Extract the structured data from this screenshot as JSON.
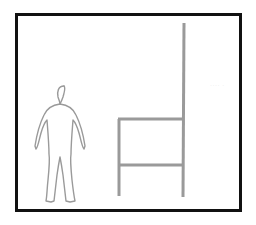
{
  "diagram": {
    "frame": {
      "border_color": "#111111",
      "background": "#ffffff"
    },
    "figure": {
      "label": "human-silhouette",
      "stroke": "#9a9a9a"
    },
    "chair": {
      "label": "high-back-chair-side-view",
      "stroke": "#9a9a9a"
    },
    "bleed_text": "···· ·"
  }
}
